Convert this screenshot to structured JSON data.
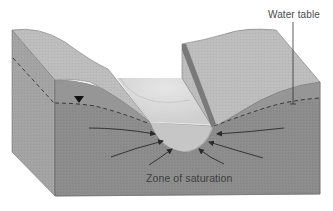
{
  "figure": {
    "labels": {
      "water_table": "Water table",
      "zone_of_saturation": "Zone of saturation"
    },
    "symbols": {
      "water_table_marker": "inverted-triangle"
    },
    "colors": {
      "background": "#ffffff",
      "land_surface": "#b9b9b9",
      "unsaturated_front": "#9a9a9a",
      "saturated_zone": "#8c8c8c",
      "side_face": "#a3a3a3",
      "stream_water": "#d4d4d4",
      "stream_bank_dark": "#7a7a7a",
      "flow_arrow": "#2a2a2a",
      "outline": "#6f6f6f"
    },
    "flow_arrows_count": 6
  }
}
